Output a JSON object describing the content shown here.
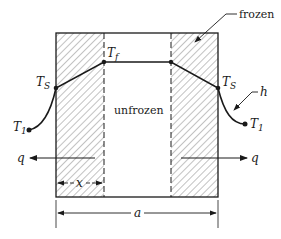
{
  "diagram": {
    "title": "",
    "labels": {
      "frozen": "frozen",
      "unfrozen": "unfrozen",
      "tf_main": "T",
      "tf_sub": "f",
      "ts_left_main": "T",
      "ts_left_sub": "S",
      "ts_right_main": "T",
      "ts_right_sub": "S",
      "t1_left_main": "T",
      "t1_left_sub": "1",
      "t1_right_main": "T",
      "t1_right_sub": "1",
      "h": "h",
      "q_left": "q",
      "q_right": "q",
      "x": "x",
      "a": "a"
    },
    "colors": {
      "line": "#1a1a1a",
      "hatch": "#555555",
      "background": "#ffffff"
    }
  }
}
